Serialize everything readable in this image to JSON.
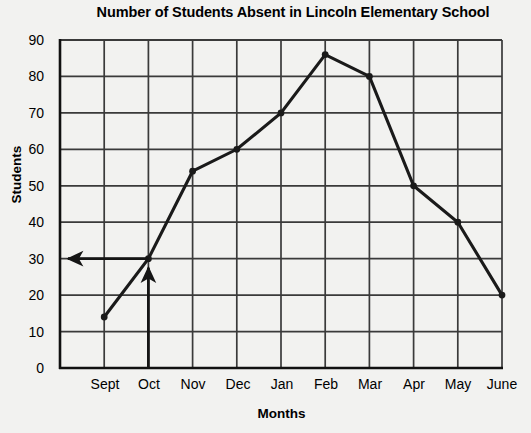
{
  "chart_data": {
    "type": "line",
    "title": "Number of Students Absent in Lincoln Elementary School",
    "xlabel": "Months",
    "ylabel": "Students",
    "categories": [
      "Sept",
      "Oct",
      "Nov",
      "Dec",
      "Jan",
      "Feb",
      "Mar",
      "Apr",
      "May",
      "June"
    ],
    "values": [
      14,
      30,
      54,
      60,
      70,
      86,
      80,
      50,
      40,
      20
    ],
    "series": [
      {
        "name": "Students Absent",
        "values": [
          14,
          30,
          54,
          60,
          70,
          86,
          80,
          50,
          40,
          20
        ]
      }
    ],
    "ylim": [
      0,
      90
    ],
    "y_ticks": [
      0,
      10,
      20,
      30,
      40,
      50,
      60,
      70,
      80,
      90
    ],
    "y_tick_labels": [
      "0",
      "10",
      "20",
      "30",
      "40",
      "50",
      "60",
      "70",
      "80",
      "90"
    ],
    "grid": true,
    "legend": false,
    "legend_position": "none",
    "line_color": "#1a1a1a",
    "marker_color": "#1a1a1a",
    "grid_color": "#3a3a3a",
    "background_color": "#f2f2f0",
    "annotations": [
      {
        "name": "horizontal-readout-arrow",
        "description": "Arrow from the October data point leftward to the y-axis at 30 students",
        "from_category": "Oct",
        "value": 30
      },
      {
        "name": "vertical-readout-arrow",
        "description": "Arrow pointing up from the x-axis at October to the data point",
        "category": "Oct",
        "value": 30
      }
    ]
  }
}
